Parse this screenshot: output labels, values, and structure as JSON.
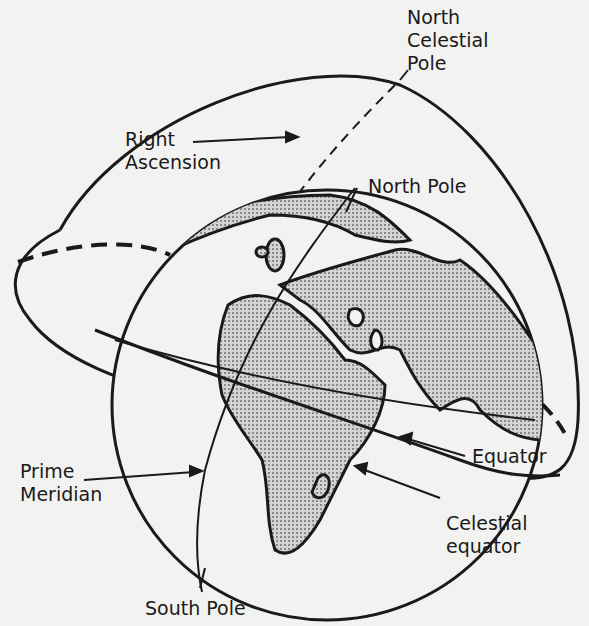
{
  "diagram": {
    "labels": {
      "north_celestial_pole": "North\nCelestial\nPole",
      "right_ascension": "Right\nAscension",
      "north_pole": "North Pole",
      "equator": "Equator",
      "prime_meridian": "Prime\nMeridian",
      "celestial_equator": "Celestial\nequator",
      "south_pole": "South Pole"
    },
    "colors": {
      "background": "#f2f2f0",
      "ink": "#1a1a1a",
      "land": "#b8b8b8"
    }
  }
}
